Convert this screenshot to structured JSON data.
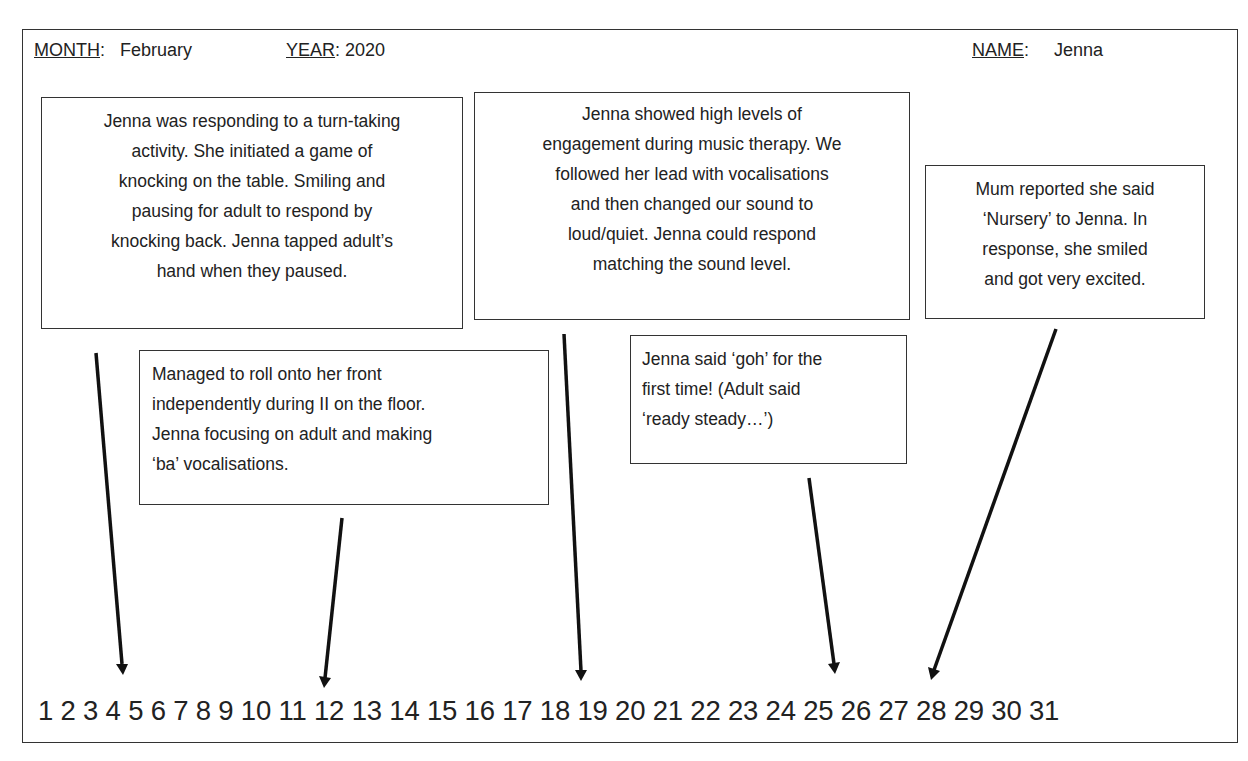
{
  "header": {
    "month_label": "MONTH",
    "month_value": "February",
    "year_label": "YEAR",
    "year_value": "2020",
    "name_label": "NAME",
    "name_value": "Jenna"
  },
  "observations": [
    {
      "day": 4,
      "lines": [
        "Jenna was responding to a turn-taking",
        "activity. She initiated a game of",
        "knocking on the table. Smiling and",
        "pausing for adult to respond by",
        "knocking back. Jenna tapped adult’s",
        "hand when they paused."
      ]
    },
    {
      "day": 11,
      "lines": [
        "Managed to roll onto her front",
        "independently  during II on the floor.",
        "Jenna focusing on adult and making",
        "‘ba’ vocalisations."
      ]
    },
    {
      "day": 17,
      "lines": [
        "Jenna showed high levels of",
        "engagement  during music therapy. We",
        "followed her lead with vocalisations",
        "and then changed our sound to",
        "loud/quiet. Jenna could respond",
        "matching the sound level."
      ]
    },
    {
      "day": 23,
      "lines": [
        "Jenna said ‘goh’ for the",
        "first time! (Adult said",
        "‘ready steady…’)"
      ]
    },
    {
      "day": 25,
      "lines": [
        "Mum reported  she said",
        "‘Nursery’ to Jenna. In",
        "response,  she smiled",
        "and got very excited."
      ]
    }
  ],
  "days_line": "1 2 3 4 5 6 7 8 9 10 11 12 13 14 15 16 17 18 19 20 21 22 23 24 25 26 27 28 29 30 31",
  "colors": {
    "ink": "#222222",
    "border": "#333333",
    "background": "#ffffff"
  }
}
